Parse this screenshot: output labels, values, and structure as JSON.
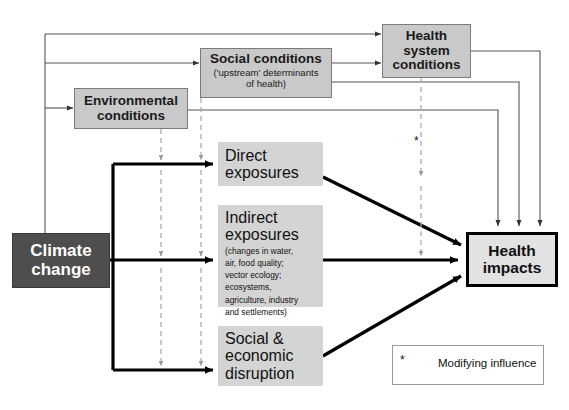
{
  "diagram": {
    "colors": {
      "source_fill": "#4e4e4e",
      "source_text": "#ffffff",
      "condition_fill": "#c9c9c9",
      "condition_border": "#7b7b7b",
      "exposure_fill": "#d4d4d4",
      "outcome_fill": "#e2e2e2",
      "outcome_border": "#000000",
      "solid_line": "#000000",
      "thin_line": "#555555",
      "dashed_line": "#aaaaaa",
      "background": "#ffffff"
    },
    "nodes": {
      "climate_change": {
        "label_line1": "Climate",
        "label_line2": "change"
      },
      "environmental_conditions": {
        "label_line1": "Environmental",
        "label_line2": "conditions"
      },
      "social_conditions": {
        "label": "Social conditions",
        "sub_line1": "('upstream' determinants",
        "sub_line2": "of health)"
      },
      "health_system_conditions": {
        "label_line1": "Health",
        "label_line2": "system",
        "label_line3": "conditions"
      },
      "direct_exposures": {
        "label_line1": "Direct",
        "label_line2": "exposures"
      },
      "indirect_exposures": {
        "label_line1": "Indirect",
        "label_line2": "exposures",
        "sub_line1": "(changes in water,",
        "sub_line2": "air, food quality;",
        "sub_line3": "vector ecology;",
        "sub_line4": "ecosystems,",
        "sub_line5": "agriculture, industry",
        "sub_line6": "and settlements)"
      },
      "social_economic_disruption": {
        "label_line1": "Social &",
        "label_line2": "economic",
        "label_line3": "disruption"
      },
      "health_impacts": {
        "label_line1": "Health",
        "label_line2": "impacts"
      }
    },
    "legend": {
      "asterisk": "*",
      "label": "Modifying influence"
    },
    "markers": {
      "modifying_influence_asterisk": "*"
    }
  }
}
